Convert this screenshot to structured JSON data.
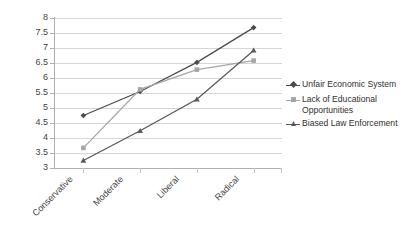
{
  "chart_data": {
    "type": "line",
    "title": "",
    "xlabel": "",
    "ylabel": "",
    "categories": [
      "Conservative",
      "Moderate",
      "Liberal",
      "Radical"
    ],
    "ylim": [
      3,
      8
    ],
    "ytick_labels": [
      "8",
      "7.5",
      "7",
      "6.5",
      "6",
      "5.5",
      "5",
      "4.5",
      "4",
      "3.5",
      "3"
    ],
    "ytick_values": [
      8,
      7.5,
      7,
      6.5,
      6,
      5.5,
      5,
      4.5,
      4,
      3.5,
      3
    ],
    "grid": true,
    "legend_position": "right",
    "series": [
      {
        "name": "Unfair Economic System",
        "values": [
          4.75,
          5.55,
          6.52,
          7.68
        ],
        "color": "#4c4c4c",
        "marker": "diamond"
      },
      {
        "name": "Lack of Educational Opportunities",
        "values": [
          3.67,
          5.62,
          6.28,
          6.58
        ],
        "color": "#a6a6a6",
        "marker": "square"
      },
      {
        "name": "Biased Law Enforcement",
        "values": [
          3.25,
          4.24,
          5.29,
          6.92
        ],
        "color": "#595959",
        "marker": "triangle"
      }
    ]
  },
  "legend": {
    "items": [
      {
        "label": "Unfair Economic System"
      },
      {
        "label": "Lack of Educational\nOpportunities"
      },
      {
        "label": "Biased Law Enforcement"
      }
    ]
  },
  "colors": {
    "gridline": "#d6d6d6",
    "axis": "#b0b0b0",
    "text": "#3f3f3f",
    "background": "#ffffff"
  }
}
